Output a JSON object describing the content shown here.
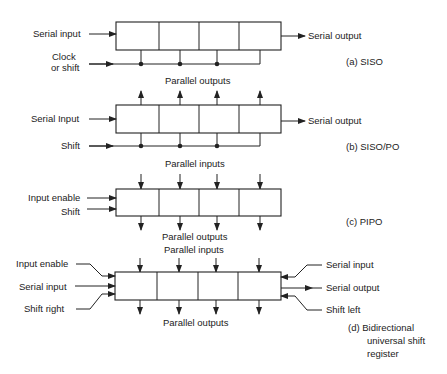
{
  "panels": {
    "a": {
      "caption": "(a)  SISO",
      "left": [
        "Serial input",
        "Clock",
        "or shift"
      ],
      "right": [
        "Serial output"
      ],
      "bottom": "Parallel outputs"
    },
    "b": {
      "caption": "(b)  SISO/PO",
      "left": [
        "Serial Input",
        "Shift"
      ],
      "right": [
        "Serial output"
      ],
      "bottom": "Parallel inputs"
    },
    "c": {
      "caption": "(c)  PIPO",
      "left": [
        "Input enable",
        "Shift"
      ],
      "bottom": "Parallel outputs"
    },
    "d": {
      "caption_lines": [
        "(d)  Bidirectional",
        "universal shift",
        "register"
      ],
      "top": "Parallel inputs",
      "left": [
        "Input enable",
        "Serial input",
        "Shift right"
      ],
      "right": [
        "Serial input",
        "Serial output",
        "Shift left"
      ],
      "bottom": "Parallel outputs"
    }
  },
  "colors": {
    "line": "#222222",
    "background": "#ffffff"
  }
}
